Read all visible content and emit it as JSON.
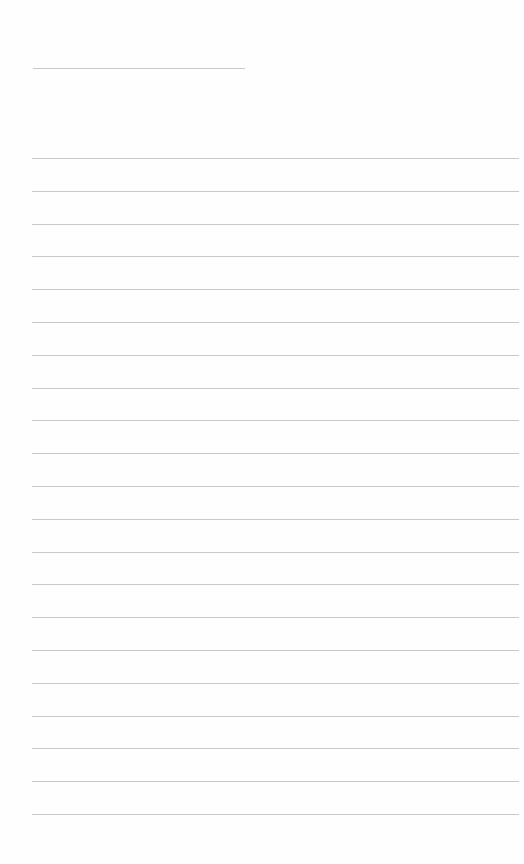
{
  "document": {
    "type": "blank lined paper",
    "header_line": {
      "x": 33,
      "y": 68,
      "width": 212
    },
    "ruled_lines": {
      "count": 21,
      "first_y": 158,
      "spacing": 32.8,
      "x": 32,
      "width": 487
    },
    "colors": {
      "paper": "#fefefe",
      "rule": "#c9c9c9"
    }
  }
}
